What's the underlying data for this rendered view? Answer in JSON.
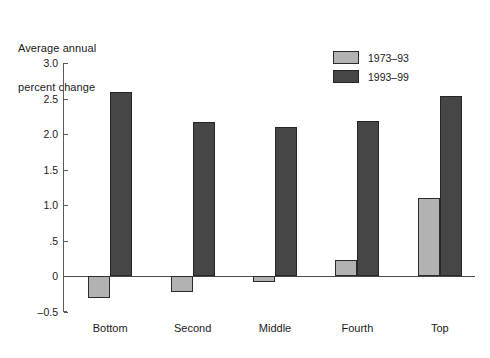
{
  "chart_data": {
    "type": "bar",
    "title": "",
    "ylabel": "Average annual percent change",
    "xlabel": "",
    "categories": [
      "Bottom",
      "Second",
      "Middle",
      "Fourth",
      "Top"
    ],
    "series": [
      {
        "name": "1973–93",
        "color": "#b2b2b2",
        "values": [
          -0.3,
          -0.22,
          -0.08,
          0.23,
          1.1
        ]
      },
      {
        "name": "1993–99",
        "color": "#464646",
        "values": [
          2.59,
          2.17,
          2.1,
          2.18,
          2.53
        ]
      }
    ],
    "ylim": [
      -0.5,
      3.0
    ],
    "yticks": [
      3.0,
      2.5,
      2.0,
      1.5,
      1.0,
      0.5,
      0.0,
      -0.5
    ],
    "ytick_labels": [
      "3.0",
      "2.5",
      "2.0",
      "1.5",
      "1.0",
      ".5",
      "0",
      "–0.5"
    ],
    "grid": false,
    "legend_position": "top-right",
    "zero_line": true
  },
  "axis_title": {
    "line1": "Average annual",
    "line2": "percent change"
  },
  "legend": {
    "items": [
      {
        "label": "1973–93",
        "style": "light"
      },
      {
        "label": "1993–99",
        "style": "dark"
      }
    ]
  }
}
